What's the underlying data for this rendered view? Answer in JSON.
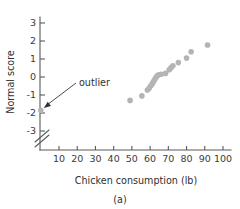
{
  "figure": {
    "caption": "(a)",
    "point_color": "#b4b4b4",
    "axis_color": "#5a5a5a",
    "text_color": "#2f2f2f"
  },
  "annotation": {
    "label": "outlier",
    "target_x": 0,
    "target_y": -1.85
  },
  "chart_data": {
    "type": "scatter",
    "title": "",
    "xlabel": "Chicken consumption (lb)",
    "ylabel": "Normal score",
    "xlim": [
      0,
      103
    ],
    "ylim": [
      -3.6,
      3.6
    ],
    "xticks": [
      10,
      20,
      30,
      40,
      50,
      60,
      70,
      80,
      90,
      100
    ],
    "yticks": [
      3,
      2,
      1,
      0,
      -1,
      -2,
      -3
    ],
    "xtick_labels": [
      "10",
      "20",
      "30",
      "40",
      "50",
      "60",
      "70",
      "80",
      "90",
      "100"
    ],
    "ytick_labels": [
      "3",
      "2",
      "1",
      "0",
      "-1",
      "-2",
      "-3"
    ],
    "grid": false,
    "legend": false,
    "axis_break": {
      "axis": "x",
      "note": "break near origin between 0 and 10"
    },
    "points": [
      {
        "x": 0.0,
        "y": -1.85,
        "label": "outlier"
      },
      {
        "x": 49.0,
        "y": -1.3
      },
      {
        "x": 55.5,
        "y": -1.05
      },
      {
        "x": 58.5,
        "y": -0.72
      },
      {
        "x": 59.5,
        "y": -0.62
      },
      {
        "x": 60.3,
        "y": -0.5
      },
      {
        "x": 61.0,
        "y": -0.4
      },
      {
        "x": 61.6,
        "y": -0.3
      },
      {
        "x": 62.2,
        "y": -0.2
      },
      {
        "x": 62.8,
        "y": -0.1
      },
      {
        "x": 63.4,
        "y": 0.0
      },
      {
        "x": 64.0,
        "y": 0.08
      },
      {
        "x": 64.8,
        "y": 0.12
      },
      {
        "x": 66.0,
        "y": 0.15
      },
      {
        "x": 68.5,
        "y": 0.2
      },
      {
        "x": 70.5,
        "y": 0.4
      },
      {
        "x": 71.5,
        "y": 0.52
      },
      {
        "x": 72.5,
        "y": 0.62
      },
      {
        "x": 75.5,
        "y": 0.8
      },
      {
        "x": 80.0,
        "y": 1.05
      },
      {
        "x": 82.5,
        "y": 1.4
      },
      {
        "x": 91.5,
        "y": 1.78
      }
    ]
  }
}
